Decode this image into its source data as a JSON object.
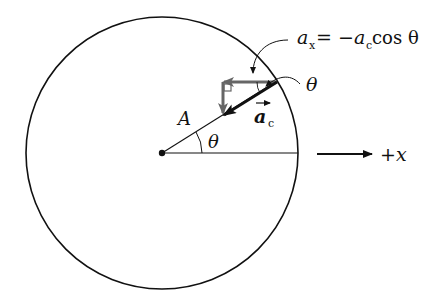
{
  "diagram": {
    "type": "uniform-circular-motion-acceleration-components",
    "labels": {
      "point": "A",
      "angle_inner": "θ",
      "angle_outer": "θ",
      "accel_vector": "a",
      "accel_vector_sub": "c",
      "equation_lhs": "a",
      "equation_lhs_sub": "x",
      "equation_rhs_prefix": " = −",
      "equation_rhs_var": "a",
      "equation_rhs_sub": "c",
      "equation_rhs_suffix": " cos θ",
      "axis": "+x"
    },
    "colors": {
      "line": "#111111",
      "components": "#666666",
      "background": "#ffffff"
    }
  }
}
